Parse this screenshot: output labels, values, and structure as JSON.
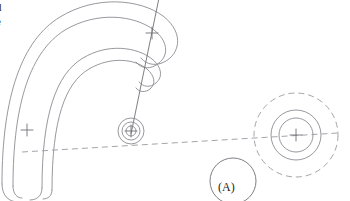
{
  "drawing": {
    "title": "Engineering line drawing - curved band with hub and concentric circle assembly",
    "background_color": "#ffffff",
    "line_color": "#8c8c93",
    "dark_line_color": "#6f6f77",
    "text_color": "#1d1d1d",
    "width": 350,
    "height": 201
  },
  "edge_text": {
    "line1": "d",
    "line2": "e"
  },
  "callouts": {
    "a_label": "(A)"
  },
  "geometry": {
    "curved_band": {
      "description": "Four nested arcs forming a hook / C shape opening downward-left",
      "arc_count": 4
    },
    "left_bend_center": {
      "x": 27,
      "y": 130
    },
    "hub": {
      "center": {
        "x": 131,
        "y": 131
      },
      "radii": [
        5,
        9,
        13
      ]
    },
    "upper_arc_center": {
      "x": 152,
      "y": 33
    },
    "right_assembly": {
      "center": {
        "x": 296,
        "y": 135
      },
      "inner_radius": 17,
      "middle_radius": 25,
      "outer_dashed_radius": 42
    },
    "callout_circle": {
      "center": {
        "x": 233,
        "y": 181
      },
      "radius": 23
    },
    "leader_line": {
      "from": {
        "x": 131,
        "y": 131
      },
      "to": {
        "x": 158,
        "y": 0
      }
    },
    "dashed_centerline": {
      "from": {
        "x": 22,
        "y": 152
      },
      "to": {
        "x": 338,
        "y": 133
      }
    }
  }
}
